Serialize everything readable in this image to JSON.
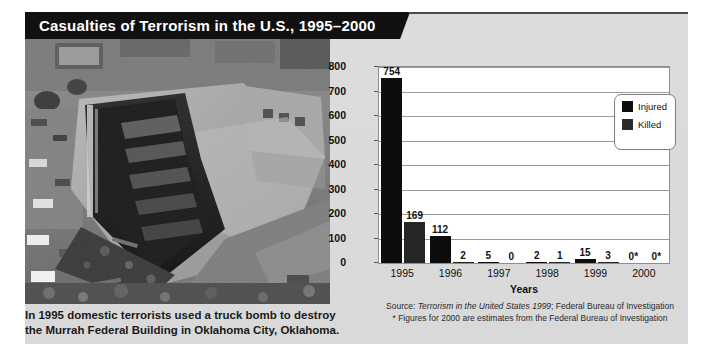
{
  "title": "Casualties of Terrorism in the U.S., 1995–2000",
  "photo": {
    "alt": "Aerial black-and-white photograph of the bombed Alfred P. Murrah Federal Building"
  },
  "caption": {
    "line1": "In 1995 domestic terrorists used a truck bomb to destroy",
    "line2": "the Murrah Federal Building in Oklahoma City, Oklahoma."
  },
  "legend": {
    "items": [
      {
        "label": "Injured",
        "color": "#0d0d0d"
      },
      {
        "label": "Killed",
        "color": "#2b2b2b"
      }
    ]
  },
  "source": {
    "prefix": "Source: ",
    "italic": "Terrorism in the United States 1999",
    "suffix": "; Federal Bureau of Investigation",
    "footnote": "* Figures for 2000 are estimates from the Federal Bureau of Investigation"
  },
  "chart_data": {
    "type": "bar",
    "title": "Casualties of Terrorism in the U.S., 1995–2000",
    "xlabel": "Years",
    "ylabel": "",
    "ylim": [
      0,
      800
    ],
    "yticks": [
      0,
      100,
      200,
      300,
      400,
      500,
      600,
      700,
      800
    ],
    "ytick_labels": [
      "0",
      "100",
      "200",
      "300",
      "400",
      "500",
      "600",
      "700",
      "800"
    ],
    "grid": true,
    "legend_position": "top-right-inside",
    "categories": [
      "1995",
      "1996",
      "1997",
      "1998",
      "1999",
      "2000"
    ],
    "series": [
      {
        "name": "Injured",
        "color": "#0d0d0d",
        "values": [
          754,
          112,
          5,
          2,
          15,
          0
        ],
        "labels": [
          "754",
          "112",
          "5",
          "2",
          "15",
          "0*"
        ]
      },
      {
        "name": "Killed",
        "color": "#2b2b2b",
        "values": [
          169,
          2,
          0,
          1,
          3,
          0
        ],
        "labels": [
          "169",
          "2",
          "0",
          "1",
          "3",
          "0*"
        ]
      }
    ],
    "annotations": [
      "* Figures for 2000 are estimates from the Federal Bureau of Investigation"
    ]
  }
}
